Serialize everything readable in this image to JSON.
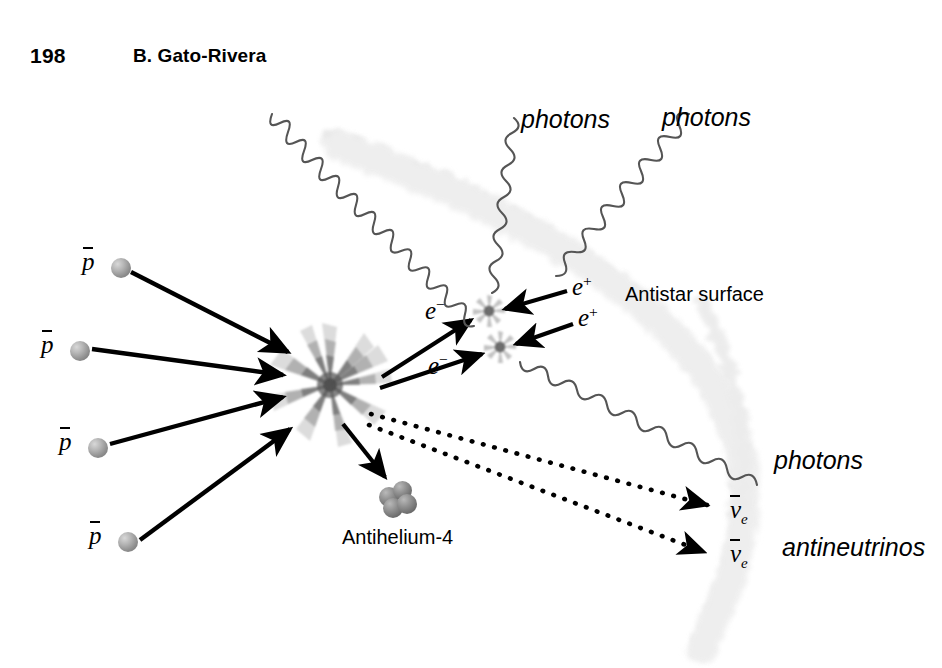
{
  "page": {
    "number": "198",
    "running_head": "B. Gato-Rivera"
  },
  "figure": {
    "background_color": "#ffffff",
    "ink_color": "#000000",
    "surface_color": "#e6e6e6",
    "sphere_color": "#9b9b9b",
    "labels": {
      "photons_top_left": "photons",
      "photons_top_right": "photons",
      "photons_right": "photons",
      "antistar_surface": "Antistar surface",
      "antihelium": "Antihelium-4",
      "antineutrinos": "antineutrinos"
    },
    "particles": {
      "antiproton": "p",
      "electron": "e",
      "electron_charge": "−",
      "positron": "e",
      "positron_charge": "+",
      "antineutrino": "ν",
      "antineutrino_sub": "e"
    },
    "incoming_antiprotons": [
      {
        "label": "p",
        "sphere_x": 111,
        "sphere_y": 261,
        "label_x": 80,
        "label_y": 248
      },
      {
        "label": "p",
        "sphere_x": 72,
        "sphere_y": 345,
        "label_x": 41,
        "label_y": 332
      },
      {
        "label": "p",
        "sphere_x": 89,
        "sphere_y": 442,
        "label_x": 58,
        "label_y": 429
      },
      {
        "label": "p",
        "sphere_x": 119,
        "sphere_y": 537,
        "label_x": 88,
        "label_y": 524
      }
    ],
    "annihilation_points": [
      {
        "name": "main-burst",
        "x": 330,
        "y": 385,
        "size": 118
      },
      {
        "name": "pair-burst-upper",
        "x": 489,
        "y": 311,
        "size": 30
      },
      {
        "name": "pair-burst-lower",
        "x": 500,
        "y": 347,
        "size": 30
      }
    ],
    "electron_labels": [
      {
        "text": "e",
        "charge": "−",
        "x": 433,
        "y": 303
      },
      {
        "text": "e",
        "charge": "−",
        "x": 435,
        "y": 358
      }
    ],
    "positron_labels": [
      {
        "text": "e",
        "charge": "+",
        "x": 572,
        "y": 280
      },
      {
        "text": "e",
        "charge": "+",
        "x": 578,
        "y": 311
      }
    ],
    "antineutrino_labels": [
      {
        "text": "ν",
        "sub": "e",
        "x": 735,
        "y": 502
      },
      {
        "text": "ν",
        "sub": "e",
        "x": 735,
        "y": 545
      }
    ],
    "antihelium": {
      "label": "Antihelium-4",
      "label_x": 347,
      "label_y": 524,
      "cluster_x": 390,
      "cluster_y": 495
    }
  }
}
